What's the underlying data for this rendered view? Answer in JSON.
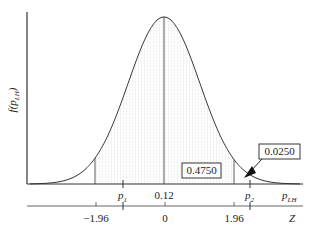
{
  "chart_data": {
    "type": "line",
    "title": "",
    "ylabel": "f(p_LH)",
    "xlabel": "p_LH",
    "secondary_xlabel": "Z",
    "mean": 0.12,
    "x_tick_labels": [
      "p1",
      "0.12",
      "p2"
    ],
    "z_tick_labels": [
      "-1.96",
      "0",
      "1.96"
    ],
    "z_ticks": [
      -1.96,
      0,
      1.96
    ],
    "shaded_region": {
      "z_from": -1.96,
      "z_to": 1.96
    },
    "annotations": [
      {
        "text": "0.4750",
        "meaning": "area between mean and Z=1.96"
      },
      {
        "text": "0.0250",
        "meaning": "upper tail area beyond Z=1.96"
      }
    ],
    "grid": false,
    "legend": null
  },
  "labels": {
    "y_axis": "f(p",
    "y_axis_sub": "LH",
    "y_axis_close": ")",
    "p1": "p",
    "p1_sub": "1",
    "mean": "0.12",
    "p2": "p",
    "p2_sub": "2",
    "x_axis": "p",
    "x_axis_sub": "LH",
    "z_neg": "−1.96",
    "z_zero": "0",
    "z_pos": "1.96",
    "z_axis": "Z",
    "area_center": "0.4750",
    "area_tail": "0.0250"
  }
}
